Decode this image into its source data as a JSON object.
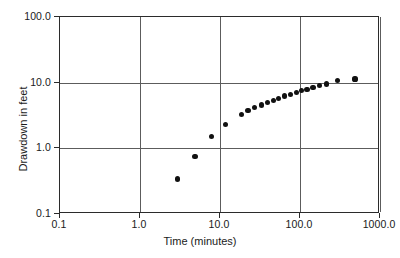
{
  "chart_data": {
    "type": "scatter",
    "title": "",
    "xlabel": "Time (minutes)",
    "ylabel": "Drawdown in feet",
    "xscale": "log",
    "yscale": "log",
    "xlim": [
      0.1,
      1000.0
    ],
    "ylim": [
      0.1,
      100.0
    ],
    "grid": true,
    "legend": null,
    "xticks": [
      0.1,
      1.0,
      10.0,
      100.0,
      1000.0
    ],
    "xticklabels": [
      "0.1",
      "1.0",
      "10.0",
      "100.0",
      "1000.0"
    ],
    "yticks": [
      0.1,
      1.0,
      10.0,
      100.0
    ],
    "yticklabels": [
      "0.1",
      "1.0",
      "10.0",
      "100.0"
    ],
    "marker": "filled-circle",
    "marker_color": "#111111",
    "series": [
      {
        "name": "drawdown",
        "points": [
          [
            3.0,
            0.33
          ],
          [
            5.0,
            0.72
          ],
          [
            8.0,
            1.45
          ],
          [
            12.0,
            2.2
          ],
          [
            19.0,
            3.2
          ],
          [
            23.0,
            3.6
          ],
          [
            28.0,
            4.0
          ],
          [
            34.0,
            4.4
          ],
          [
            40.0,
            4.75
          ],
          [
            48.0,
            5.2
          ],
          [
            56.0,
            5.6
          ],
          [
            66.0,
            6.05
          ],
          [
            78.0,
            6.45
          ],
          [
            92.0,
            6.85
          ],
          [
            108.0,
            7.25
          ],
          [
            126.0,
            7.7
          ],
          [
            150.0,
            8.2
          ],
          [
            180.0,
            8.7
          ],
          [
            220.0,
            9.2
          ],
          [
            300.0,
            10.3
          ],
          [
            500.0,
            11.0
          ]
        ]
      }
    ]
  },
  "axes": {
    "x_title": "Time (minutes)",
    "y_title": "Drawdown in feet",
    "x_tick_labels": [
      "0.1",
      "1.0",
      "10.0",
      "100.0",
      "1000.0"
    ],
    "y_tick_labels": [
      "0.1",
      "1.0",
      "10.0",
      "100.0"
    ]
  },
  "colors": {
    "frame": "#2b2b2b",
    "grid": "#5c5c5c",
    "marker": "#111111",
    "background": "#ffffff"
  }
}
